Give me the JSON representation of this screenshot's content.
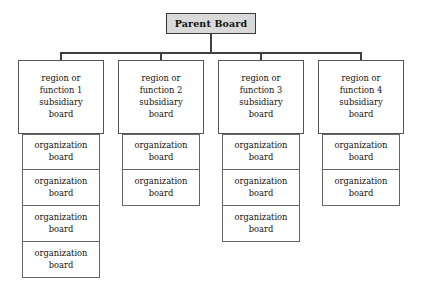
{
  "diagram": {
    "colors": {
      "page_background": "#ffffff",
      "parent_fill": "#d9d9d9",
      "parent_border": "#3a3a3a",
      "box_fill": "#ffffff",
      "box_border": "#555555",
      "connector": "#3f3f3f",
      "text": "#15120f"
    },
    "parent": {
      "label": "Parent Board"
    },
    "organization_label_lines": [
      "organization",
      "board"
    ],
    "columns": [
      {
        "id": "column-1",
        "subsidiary": {
          "lines": [
            "region or",
            "function 1",
            "subsidiary",
            "board"
          ],
          "full_label": "region or function 1 subsidiary board"
        },
        "organization_count": 4,
        "organizations": [
          {
            "lines": [
              "organization",
              "board"
            ]
          },
          {
            "lines": [
              "organization",
              "board"
            ]
          },
          {
            "lines": [
              "organization",
              "board"
            ]
          },
          {
            "lines": [
              "organization",
              "board"
            ]
          }
        ]
      },
      {
        "id": "column-2",
        "subsidiary": {
          "lines": [
            "region or",
            "function 2",
            "subsidiary",
            "board"
          ],
          "full_label": "region or function 2 subsidiary board"
        },
        "organization_count": 2,
        "organizations": [
          {
            "lines": [
              "organization",
              "board"
            ]
          },
          {
            "lines": [
              "organization",
              "board"
            ]
          }
        ]
      },
      {
        "id": "column-3",
        "subsidiary": {
          "lines": [
            "region or",
            "function 3",
            "subsidiary",
            "board"
          ],
          "full_label": "region or function 3 subsidiary board"
        },
        "organization_count": 3,
        "organizations": [
          {
            "lines": [
              "organization",
              "board"
            ]
          },
          {
            "lines": [
              "organization",
              "board"
            ]
          },
          {
            "lines": [
              "organization",
              "board"
            ]
          }
        ]
      },
      {
        "id": "column-4",
        "subsidiary": {
          "lines": [
            "region or",
            "function 4",
            "subsidiary",
            "board"
          ],
          "full_label": "region or function 4 subsidiary board"
        },
        "organization_count": 2,
        "organizations": [
          {
            "lines": [
              "organization",
              "board"
            ]
          },
          {
            "lines": [
              "organization",
              "board"
            ]
          }
        ]
      }
    ],
    "layout": {
      "column_left_positions": [
        18,
        118,
        218,
        318
      ],
      "connector_drop_positions": [
        60,
        160,
        260,
        360
      ],
      "bus_y": 52
    }
  }
}
